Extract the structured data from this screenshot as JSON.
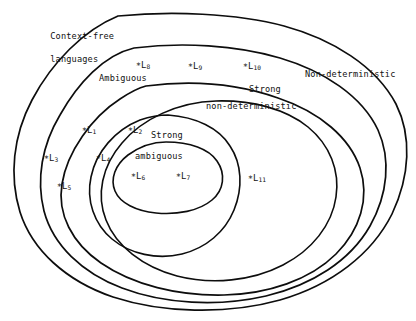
{
  "figure": {
    "background_color": "#ffffff",
    "stroke_color": "#0d0d0d",
    "width": 416,
    "height": 321
  },
  "regions": [
    {
      "id": "context-free",
      "label": "Context-free\nlanguages",
      "line1": "Context-free",
      "line2": "languages"
    },
    {
      "id": "ambiguous",
      "label": "Ambiguous",
      "line1": "Ambiguous",
      "line2": ""
    },
    {
      "id": "non-deterministic",
      "label": "Non-deterministic",
      "line1": "Non-deterministic",
      "line2": ""
    },
    {
      "id": "strong-non-deterministic",
      "label": "Strong\nnon-deterministic",
      "line1": "Strong",
      "line2": "non-deterministic"
    },
    {
      "id": "strong-ambiguous",
      "label": "Strong\nambiguous",
      "line1": "Strong",
      "line2": "ambiguous"
    }
  ],
  "points": [
    {
      "id": "L1",
      "star": "∗",
      "base": "L",
      "sub": "1"
    },
    {
      "id": "L2",
      "star": "∗",
      "base": "L",
      "sub": "2"
    },
    {
      "id": "L3",
      "star": "∗",
      "base": "L",
      "sub": "3"
    },
    {
      "id": "L4",
      "star": "∗",
      "base": "L",
      "sub": "4"
    },
    {
      "id": "L5",
      "star": "∗",
      "base": "L",
      "sub": "5"
    },
    {
      "id": "L6",
      "star": "∗",
      "base": "L",
      "sub": "6"
    },
    {
      "id": "L7",
      "star": "∗",
      "base": "L",
      "sub": "7"
    },
    {
      "id": "L8",
      "star": "∗",
      "base": "L",
      "sub": "8"
    },
    {
      "id": "L9",
      "star": "∗",
      "base": "L",
      "sub": "9"
    },
    {
      "id": "L10",
      "star": "∗",
      "base": "L",
      "sub": "10"
    },
    {
      "id": "L11",
      "star": "∗",
      "base": "L",
      "sub": "11"
    }
  ]
}
